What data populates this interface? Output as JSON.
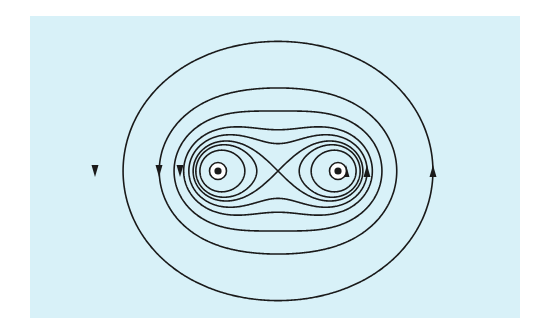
{
  "figure": {
    "background_color": "#d8f1f8",
    "line_color": "#1a1a1a",
    "panel": {
      "x": 30,
      "y": 16,
      "width": 490,
      "height": 302
    },
    "center": {
      "x": 278,
      "y": 171
    },
    "half_separation": 60,
    "conductors": [
      {
        "name": "left-wire",
        "x": 218,
        "y": 171,
        "current_direction": "out-of-page"
      },
      {
        "name": "right-wire",
        "x": 338,
        "y": 171,
        "current_direction": "out-of-page"
      }
    ],
    "field_lines": {
      "inner_loops_C": [
        2500,
        3150
      ],
      "separatrix_C": 3600,
      "enclosing_C": [
        4350,
        5300,
        7200,
        10500,
        20400
      ],
      "y_scale": 1.0
    },
    "arrows": [
      {
        "x": 95,
        "y": 171,
        "dir": "down"
      },
      {
        "x": 159,
        "y": 171,
        "dir": "down"
      },
      {
        "x": 180,
        "y": 171,
        "dir": "down"
      },
      {
        "x": 346,
        "y": 171,
        "dir": "up"
      },
      {
        "x": 367,
        "y": 171,
        "dir": "up"
      },
      {
        "x": 433,
        "y": 171,
        "dir": "up"
      }
    ],
    "circulation": "counterclockwise"
  }
}
